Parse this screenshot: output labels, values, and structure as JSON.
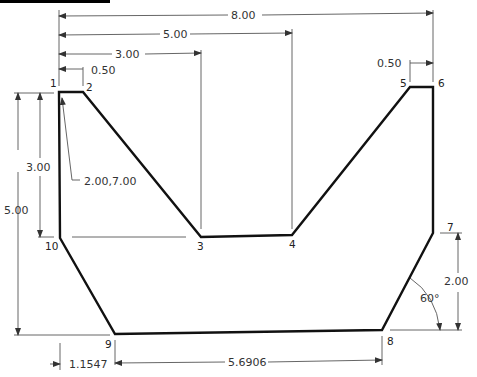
{
  "drawing": {
    "points": [
      {
        "id": "1",
        "label": "1"
      },
      {
        "id": "2",
        "label": "2"
      },
      {
        "id": "3",
        "label": "3"
      },
      {
        "id": "4",
        "label": "4"
      },
      {
        "id": "5",
        "label": "5"
      },
      {
        "id": "6",
        "label": "6"
      },
      {
        "id": "7",
        "label": "7"
      },
      {
        "id": "8",
        "label": "8"
      },
      {
        "id": "9",
        "label": "9"
      },
      {
        "id": "10",
        "label": "10"
      }
    ],
    "dimensions": {
      "overall_width": "8.00",
      "to_point4": "5.00",
      "to_point3": "3.00",
      "top_left_flat": "0.50",
      "top_right_flat": "0.50",
      "left_height_small": "3.00",
      "left_height_total": "5.00",
      "right_height": "2.00",
      "bottom_left_offset": "1.1547",
      "bottom_length": "5.6906",
      "angle": "60°"
    },
    "callout": "2.00,7.00"
  }
}
